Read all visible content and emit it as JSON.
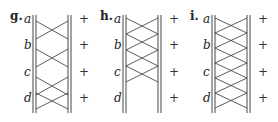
{
  "panels": [
    {
      "label": "g.",
      "x_label": 10,
      "x_left": 33,
      "x_right": 69,
      "x_plus": 79,
      "rows": [
        "a",
        "b",
        "c",
        "d"
      ],
      "row_y": [
        23,
        49,
        76,
        102
      ],
      "plus": [
        "+",
        "+",
        "+",
        "+"
      ],
      "crosses": [
        [
          21,
          39
        ],
        [
          49,
          67
        ],
        [
          77,
          95
        ],
        [
          93,
          109
        ]
      ]
    },
    {
      "label": "h.",
      "x_label": 100,
      "x_left": 123,
      "x_right": 159,
      "x_plus": 169,
      "rows": [
        "a",
        "b",
        "c",
        "d"
      ],
      "row_y": [
        23,
        49,
        76,
        102
      ],
      "plus": [
        "+",
        "+",
        "+",
        "+"
      ],
      "crosses": [
        [
          18,
          34
        ],
        [
          34,
          50
        ],
        [
          50,
          66
        ],
        [
          66,
          82
        ]
      ]
    },
    {
      "label": "i.",
      "x_label": 190,
      "x_left": 212,
      "x_right": 248,
      "x_plus": 258,
      "rows": [
        "a",
        "b",
        "c",
        "d"
      ],
      "row_y": [
        23,
        49,
        76,
        102
      ],
      "plus": [
        "+",
        "+",
        "+",
        "+"
      ],
      "crosses": [
        [
          18,
          33
        ],
        [
          33,
          48
        ],
        [
          48,
          63
        ],
        [
          63,
          78
        ],
        [
          78,
          93
        ],
        [
          93,
          108
        ]
      ]
    }
  ],
  "rail_top": 15,
  "rail_bottom": 113
}
